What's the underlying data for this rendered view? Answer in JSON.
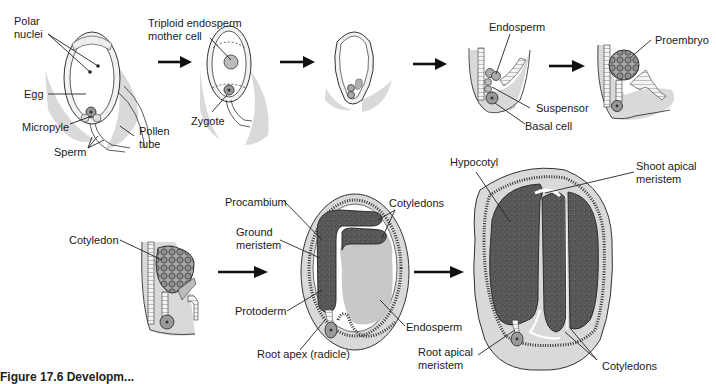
{
  "figure": {
    "caption_partial": "Figure 17.6  Developm..."
  },
  "stages": [
    {
      "id": "fertilization",
      "labels": {
        "polar_nuclei": "Polar\nnuclei",
        "polar_line1": "Polar",
        "polar_line2": "nuclei",
        "egg": "Egg",
        "micropyle": "Micropyle",
        "sperm": "Sperm",
        "pollen_tube_line1": "Pollen",
        "pollen_tube_line2": "tube"
      }
    },
    {
      "id": "zygote",
      "labels": {
        "triploid_line1": "Triploid endosperm",
        "triploid_line2": "mother cell",
        "zygote": "Zygote"
      }
    },
    {
      "id": "first-division",
      "labels": {}
    },
    {
      "id": "suspensor",
      "labels": {
        "endosperm": "Endosperm",
        "suspensor": "Suspensor",
        "basal_cell": "Basal cell"
      }
    },
    {
      "id": "proembryo",
      "labels": {
        "proembryo": "Proembryo"
      }
    },
    {
      "id": "heart",
      "labels": {
        "cotyledon": "Cotyledon"
      }
    },
    {
      "id": "torpedo",
      "labels": {
        "procambium": "Procambium",
        "ground_line1": "Ground",
        "ground_line2": "meristem",
        "cotyledons": "Cotyledons",
        "protoderm": "Protoderm",
        "endosperm": "Endosperm",
        "root_apex": "Root apex (radicle)"
      }
    },
    {
      "id": "mature",
      "labels": {
        "hypocotyl": "Hypocotyl",
        "shoot_line1": "Shoot apical",
        "shoot_line2": "meristem",
        "root_line1": "Root apical",
        "root_line2": "meristem",
        "cotyledons": "Cotyledons"
      }
    }
  ],
  "arrows": [
    "fertilization-to-zygote",
    "zygote-to-division",
    "division-to-suspensor",
    "suspensor-to-proembryo",
    "heart-to-torpedo",
    "torpedo-to-mature"
  ],
  "colors": {
    "shade": "#d9d9d9",
    "ink": "#111111",
    "background": "#ffffff"
  }
}
